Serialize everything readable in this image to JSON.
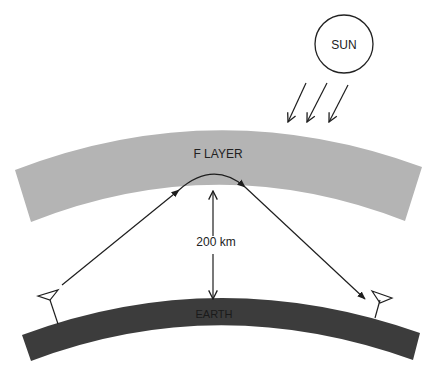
{
  "diagram": {
    "labels": {
      "sun": "SUN",
      "f_layer": "F  LAYER",
      "distance": "200 km",
      "earth": "EARTH"
    },
    "colors": {
      "background": "#ffffff",
      "f_layer": "#b4b4b4",
      "earth": "#3c3c3c",
      "lines": "#1e1e1e"
    },
    "elements": {
      "sun_rays_count": 3,
      "antennas": [
        "transmitter",
        "receiver"
      ]
    }
  }
}
